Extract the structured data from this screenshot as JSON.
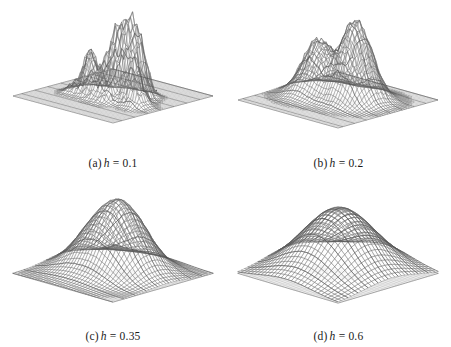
{
  "figure": {
    "background_color": "#ffffff",
    "ink_color": "#3a3a3a",
    "mesh_color": "#8c8c8c",
    "point_color": "#5a5a5a",
    "layout": "2x2 grid of 3D wireframe surface plots"
  },
  "chart_data": [
    {
      "type": "surface",
      "id": "panel-a",
      "title": "(a) h = 0.1",
      "bandwidth": 0.1,
      "xlabel": "",
      "ylabel": "",
      "zlabel": "",
      "grid": true,
      "legend": "none",
      "description": "Kernel density estimate surface with very small bandwidth; many tall narrow spikes, highly undersmoothed",
      "peak_count": 14,
      "max_height": 1.0,
      "peaks": [
        {
          "x": 0.3,
          "y": 0.52,
          "h": 0.86
        },
        {
          "x": 0.44,
          "y": 0.47,
          "h": 0.62
        },
        {
          "x": 0.5,
          "y": 0.44,
          "h": 0.95
        },
        {
          "x": 0.55,
          "y": 0.5,
          "h": 0.7
        },
        {
          "x": 0.6,
          "y": 0.42,
          "h": 0.88
        },
        {
          "x": 0.64,
          "y": 0.48,
          "h": 0.74
        },
        {
          "x": 0.68,
          "y": 0.4,
          "h": 1.0
        },
        {
          "x": 0.72,
          "y": 0.52,
          "h": 0.56
        },
        {
          "x": 0.38,
          "y": 0.6,
          "h": 0.4
        },
        {
          "x": 0.47,
          "y": 0.62,
          "h": 0.34
        },
        {
          "x": 0.58,
          "y": 0.63,
          "h": 0.3
        },
        {
          "x": 0.78,
          "y": 0.55,
          "h": 0.42
        },
        {
          "x": 0.84,
          "y": 0.58,
          "h": 0.26
        },
        {
          "x": 0.25,
          "y": 0.62,
          "h": 0.22
        }
      ],
      "mesh_n": 40,
      "scatter_points": 180
    },
    {
      "type": "surface",
      "id": "panel-b",
      "title": "(b) h = 0.2",
      "bandwidth": 0.2,
      "xlabel": "",
      "ylabel": "",
      "zlabel": "",
      "grid": true,
      "legend": "none",
      "description": "Kernel density estimate surface with moderate bandwidth; a smaller left peak and a taller right peak",
      "peak_count": 2,
      "max_height": 1.0,
      "peaks": [
        {
          "x": 0.3,
          "y": 0.5,
          "h": 0.66
        },
        {
          "x": 0.62,
          "y": 0.44,
          "h": 1.0
        }
      ],
      "mesh_n": 40,
      "scatter_points": 180
    },
    {
      "type": "surface",
      "id": "panel-c",
      "title": "(c) h = 0.35",
      "bandwidth": 0.35,
      "xlabel": "",
      "ylabel": "",
      "zlabel": "",
      "grid": true,
      "legend": "none",
      "description": "Kernel density estimate surface with larger bandwidth; a small left shoulder and a dominant right peak, smoother",
      "peak_count": 2,
      "max_height": 1.0,
      "peaks": [
        {
          "x": 0.33,
          "y": 0.5,
          "h": 0.6
        },
        {
          "x": 0.58,
          "y": 0.45,
          "h": 1.0
        }
      ],
      "mesh_n": 34,
      "scatter_points": 180
    },
    {
      "type": "surface",
      "id": "panel-d",
      "title": "(d) h = 0.6",
      "bandwidth": 0.6,
      "xlabel": "",
      "ylabel": "",
      "zlabel": "",
      "grid": true,
      "legend": "none",
      "description": "Kernel density estimate surface with large bandwidth; a single broad smooth unimodal mound, oversmoothed",
      "peak_count": 1,
      "max_height": 1.0,
      "peaks": [
        {
          "x": 0.48,
          "y": 0.47,
          "h": 1.0
        }
      ],
      "mesh_n": 28,
      "scatter_points": 180
    }
  ],
  "panels": [
    {
      "key": "a",
      "label": "(a)",
      "symbol": "h",
      "equals": "=",
      "value": "0.1",
      "caption": "(a) h = 0.1"
    },
    {
      "key": "b",
      "label": "(b)",
      "symbol": "h",
      "equals": "=",
      "value": "0.2",
      "caption": "(b) h = 0.2"
    },
    {
      "key": "c",
      "label": "(c)",
      "symbol": "h",
      "equals": "=",
      "value": "0.35",
      "caption": "(c) h = 0.35"
    },
    {
      "key": "d",
      "label": "(d)",
      "symbol": "h",
      "equals": "=",
      "value": "0.6",
      "caption": "(d) h = 0.6"
    }
  ]
}
